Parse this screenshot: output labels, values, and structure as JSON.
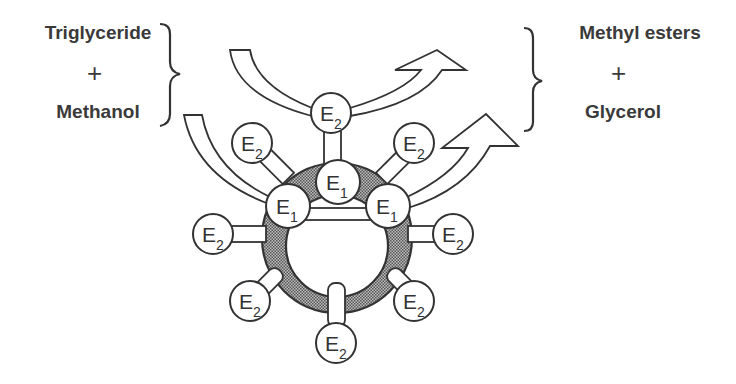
{
  "diagram": {
    "type": "enzyme-catalysis-schematic",
    "reactants": {
      "items": [
        "Triglyceride",
        "Methanol"
      ],
      "operator": "+"
    },
    "products": {
      "items": [
        "Methyl esters",
        "Glycerol"
      ],
      "operator": "+"
    },
    "enzymes": {
      "e1": {
        "letter": "E",
        "subscript": "1",
        "count": 3
      },
      "e2": {
        "letter": "E",
        "subscript": "2",
        "count": 8
      }
    },
    "colors": {
      "stroke": "#333333",
      "ring_fill": "#8a8a8a",
      "node_fill": "#ffffff",
      "text": "#3a3a3a"
    }
  }
}
